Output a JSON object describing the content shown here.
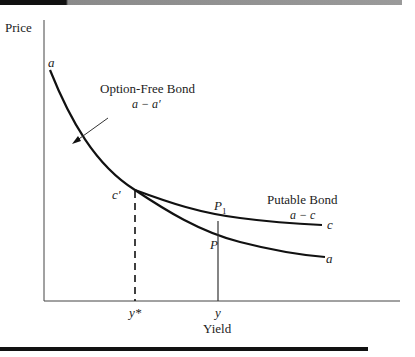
{
  "figure": {
    "y_axis_label": "Price",
    "x_axis_label": "Yield",
    "curve_labels": {
      "option_free_title": "Option-Free Bond",
      "option_free_sub": "a − a′",
      "putable_title": "Putable Bond",
      "putable_sub": "a − c"
    },
    "point_labels": {
      "a_start": "a",
      "a_end": "a",
      "c_end": "c",
      "c_prime": "c′",
      "p1": "P",
      "p1_sub": "1",
      "p": "P"
    },
    "tick_labels": {
      "y_star": "y*",
      "y": "y"
    }
  },
  "colors": {
    "line": "#111111",
    "text": "#222222",
    "topbar_dark": "#111111",
    "topbar_light": "#9a9a9a"
  }
}
